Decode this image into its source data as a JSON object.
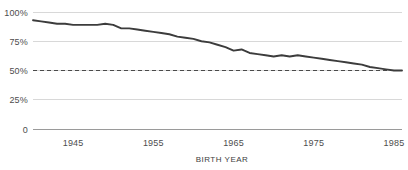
{
  "chart_data": {
    "type": "line",
    "title": "",
    "subtitle": "",
    "xlabel": "BIRTH YEAR",
    "ylabel": "",
    "xlim": [
      1940,
      1986
    ],
    "ylim": [
      0,
      100
    ],
    "grid": true,
    "legend": "none",
    "line_color": "#3c3c3c",
    "grid_color": "#d8d8d8",
    "axis_color": "#9a9a9a",
    "reference_line": {
      "name": "fifty-percent-reference",
      "value": 50,
      "style": "dashed",
      "color": "#4a4a4a"
    },
    "y_ticks": [
      {
        "value": 100,
        "label": "100%"
      },
      {
        "value": 75,
        "label": "75%"
      },
      {
        "value": 50,
        "label": "50%"
      },
      {
        "value": 25,
        "label": "25%"
      },
      {
        "value": 0,
        "label": "0"
      }
    ],
    "x_ticks": [
      {
        "value": 1945,
        "label": "1945"
      },
      {
        "value": 1955,
        "label": "1955"
      },
      {
        "value": 1965,
        "label": "1965"
      },
      {
        "value": 1975,
        "label": "1975"
      },
      {
        "value": 1985,
        "label": "1985"
      }
    ],
    "x": [
      1940,
      1941,
      1942,
      1943,
      1944,
      1945,
      1946,
      1947,
      1948,
      1949,
      1950,
      1951,
      1952,
      1953,
      1954,
      1955,
      1956,
      1957,
      1958,
      1959,
      1960,
      1961,
      1962,
      1963,
      1964,
      1965,
      1966,
      1967,
      1968,
      1969,
      1970,
      1971,
      1972,
      1973,
      1974,
      1975,
      1976,
      1977,
      1978,
      1979,
      1980,
      1981,
      1982,
      1983,
      1984,
      1985,
      1986
    ],
    "series": [
      {
        "name": "share-earning-more-than-parents",
        "values": [
          93,
          92,
          91,
          90,
          90,
          89,
          89,
          89,
          89,
          90,
          89,
          86,
          86,
          85,
          84,
          83,
          82,
          81,
          79,
          78,
          77,
          75,
          74,
          72,
          70,
          67,
          68,
          65,
          64,
          63,
          62,
          63,
          62,
          63,
          62,
          61,
          60,
          59,
          58,
          57,
          56,
          55,
          53,
          52,
          51,
          50,
          50
        ]
      }
    ]
  }
}
